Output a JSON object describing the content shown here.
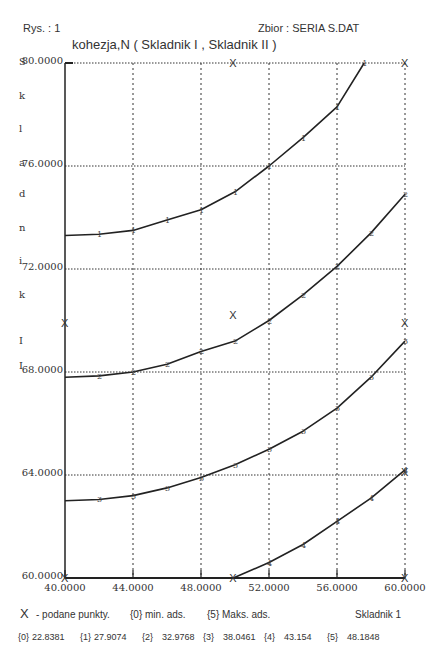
{
  "header": {
    "figure_label": "Rys. : 1",
    "dataset_label": "Zbior :  SERIA S.DAT"
  },
  "chart_data": {
    "type": "line",
    "title": "kohezja,N ( Skladnik I  ,  Skladnik II )",
    "ylabel_vertical": [
      "S",
      "k",
      "l",
      "a",
      "d",
      "n",
      "i",
      "k",
      "I",
      "I"
    ],
    "xlabel": "Skladnik  1",
    "xlim": [
      40,
      60
    ],
    "ylim": [
      60,
      80
    ],
    "xticks": [
      "40.0000",
      "44.0000",
      "48.0000",
      "52.0000",
      "56.0000",
      "60.0000"
    ],
    "xtick_values": [
      40,
      44,
      48,
      52,
      56,
      60
    ],
    "yticks": [
      "80.0000",
      "76.0000",
      "72.0000",
      "68.0000",
      "64.0000",
      "60.0000"
    ],
    "ytick_values": [
      80,
      76,
      72,
      68,
      64,
      60
    ],
    "grid": true,
    "series": [
      {
        "name": "1",
        "marker": "1",
        "x": [
          40,
          42,
          44,
          46,
          48,
          50,
          52,
          54,
          56,
          57.6
        ],
        "y": [
          73.3,
          73.35,
          73.5,
          73.9,
          74.3,
          75.0,
          76.0,
          77.1,
          78.3,
          80.0
        ]
      },
      {
        "name": "2",
        "marker": "2",
        "x": [
          40,
          42,
          44,
          46,
          48,
          50,
          52,
          54,
          56,
          58,
          60
        ],
        "y": [
          67.8,
          67.85,
          68.0,
          68.3,
          68.8,
          69.2,
          70.0,
          71.0,
          72.1,
          73.4,
          74.9
        ]
      },
      {
        "name": "3",
        "marker": "3",
        "x": [
          40,
          42,
          44,
          46,
          48,
          50,
          52,
          54,
          56,
          58,
          60
        ],
        "y": [
          63.0,
          63.05,
          63.2,
          63.5,
          63.9,
          64.4,
          65.0,
          65.7,
          66.6,
          67.8,
          69.2
        ]
      },
      {
        "name": "4",
        "marker": "4",
        "x": [
          49.9,
          52,
          54,
          56,
          58,
          60
        ],
        "y": [
          60.0,
          60.6,
          61.3,
          62.2,
          63.1,
          64.2
        ]
      }
    ],
    "given_points": {
      "marker": "X",
      "x": [
        49.9,
        60,
        40,
        49.9,
        60,
        40,
        49.9,
        60,
        60
      ],
      "y": [
        80,
        80,
        69.9,
        70.2,
        69.9,
        60,
        60,
        60,
        64.1
      ]
    },
    "legend": {
      "marker": "X",
      "given_points": "- podane  punkty.",
      "min_label": "{0}  min.  ads.",
      "max_label": "{5}  Maks.  ads."
    },
    "levels": [
      {
        "key": "{0}",
        "value": "22.8381"
      },
      {
        "key": "{1}",
        "value": "27.9074"
      },
      {
        "key": "{2}",
        "value": "32.9768"
      },
      {
        "key": "{3}",
        "value": "38.0461"
      },
      {
        "key": "{4}",
        "value": "43.154"
      },
      {
        "key": "{5}",
        "value": "48.1848"
      }
    ]
  }
}
